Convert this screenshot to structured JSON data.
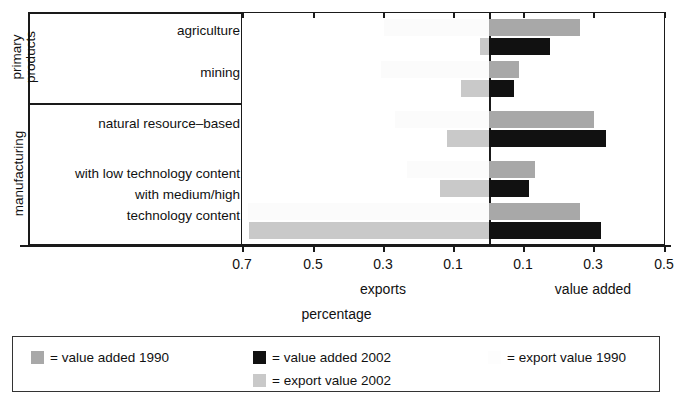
{
  "chart_data": {
    "type": "bar",
    "orientation": "horizontal",
    "title": "",
    "xlabel": "percentage",
    "ylabel": "",
    "grid": false,
    "left_axis_label": "exports",
    "right_axis_label": "value added",
    "axis_note": "Diverging (butterfly) bar chart: exports extend left of zero, value added extends right of zero.",
    "x_ticks_left": [
      "0.7",
      "0.5",
      "0.3",
      "0.1"
    ],
    "x_ticks_right": [
      "0.1",
      "0.3",
      "0.5"
    ],
    "xlim_left": 0.7,
    "xlim_right": 0.5,
    "categories": [
      "agriculture",
      "mining",
      "natural resource–based",
      "with low technology content",
      "with medium/high technology content"
    ],
    "groups": [
      {
        "label": "primary products",
        "categories": [
          "agriculture",
          "mining"
        ]
      },
      {
        "label": "manufacturing",
        "categories": [
          "natural resource–based",
          "with low technology content",
          "with medium/high technology content"
        ]
      }
    ],
    "series": [
      {
        "name": "value added 1990",
        "side": "right",
        "color": "#a8a8a8",
        "values": [
          0.26,
          0.085,
          0.3,
          0.13,
          0.26
        ]
      },
      {
        "name": "value added 2002",
        "side": "right",
        "color": "#111111",
        "values": [
          0.175,
          0.07,
          0.335,
          0.115,
          0.32
        ]
      },
      {
        "name": "export value 1990",
        "side": "left",
        "color": "#fbfbfb",
        "values": [
          0.3,
          0.31,
          0.27,
          0.235,
          0.69
        ]
      },
      {
        "name": "export value 2002",
        "side": "left",
        "color": "#c9c9c9",
        "values": [
          0.025,
          0.08,
          0.12,
          0.14,
          0.685
        ]
      }
    ]
  },
  "axis": {
    "ticks": [
      {
        "label": "0.7",
        "x": 242
      },
      {
        "label": "0.5",
        "x": 313
      },
      {
        "label": "0.3",
        "x": 383
      },
      {
        "label": "0.1",
        "x": 453
      },
      {
        "label": "0.1",
        "x": 523
      },
      {
        "label": "0.3",
        "x": 593
      },
      {
        "label": "0.5",
        "x": 664
      }
    ],
    "left_label": "exports",
    "right_label": "value added",
    "title": "percentage"
  },
  "categories": {
    "rows": [
      {
        "label": "agriculture"
      },
      {
        "label": "mining"
      },
      {
        "label": "natural resource–based"
      },
      {
        "label": "with low technology content"
      },
      {
        "label": "with medium/high"
      },
      {
        "label": "technology content"
      }
    ]
  },
  "groups": {
    "primary_line1": "primary",
    "primary_line2": "products",
    "manufacturing": "manufacturing"
  },
  "legend": {
    "items": [
      {
        "label": "= value added 1990",
        "swatch": "va90"
      },
      {
        "label": "= value added 2002",
        "swatch": "va02"
      },
      {
        "label": "= export value 1990",
        "swatch": "ex90"
      },
      {
        "label": "= export value 2002",
        "swatch": "ex02"
      }
    ]
  }
}
